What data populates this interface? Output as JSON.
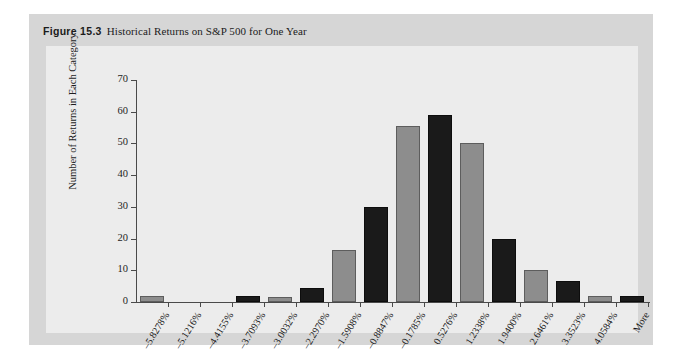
{
  "figure": {
    "label": "Figure 15.3",
    "caption": "Historical Returns on S&P 500 for One Year"
  },
  "colors": {
    "page_background": "#ffffff",
    "figure_background": "#d6d6d6",
    "plot_background": "#ececec",
    "bar_gray": "#8d8d8d",
    "bar_dark": "#1a1a1a",
    "axis": "#4a4a4a",
    "text": "#1b1b1b"
  },
  "chart_data": {
    "type": "bar",
    "title": "Historical Returns on S&P 500 for One Year",
    "xlabel": "",
    "ylabel": "Number of Returns in Each Category",
    "ylim": [
      0,
      70
    ],
    "yticks": [
      0,
      10,
      20,
      30,
      40,
      50,
      60,
      70
    ],
    "grid": false,
    "legend": "none",
    "categories": [
      "–5.8278%",
      "–5.1216%",
      "–4.4155%",
      "–3.7093%",
      "–3.0032%",
      "–2.2970%",
      "–1.5908%",
      "–0.8847%",
      "–0.1785%",
      "0.5276%",
      "1.2338%",
      "1.9400%",
      "2.6461%",
      "3.3523%",
      "4.0584%",
      "More"
    ],
    "values": [
      2,
      0,
      0,
      2,
      1.5,
      4.5,
      16.5,
      30,
      55.5,
      59,
      50,
      20,
      10,
      6.5,
      2,
      2
    ],
    "bar_colors": [
      "gray",
      "gray",
      "gray",
      "dark",
      "gray",
      "dark",
      "gray",
      "dark",
      "gray",
      "dark",
      "gray",
      "dark",
      "gray",
      "dark",
      "gray",
      "dark"
    ]
  }
}
